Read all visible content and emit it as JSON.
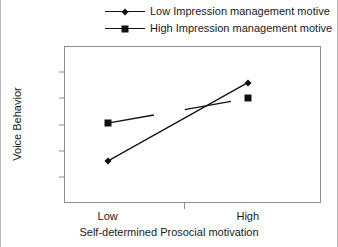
{
  "chart_data": {
    "type": "line",
    "title": "",
    "xlabel": "Self-determined Prosocial motivation",
    "ylabel": "Voice Behavior",
    "categories": [
      "Low",
      "High"
    ],
    "ylim": [
      1,
      2.2
    ],
    "yticks": [
      "1",
      "1.2",
      "1.4",
      "1.6",
      "1.8",
      "2",
      "2.2"
    ],
    "ytick_values": [
      1,
      1.2,
      1.4,
      1.6,
      1.8,
      2,
      2.2
    ],
    "grid": false,
    "legend_position": "top-center",
    "series": [
      {
        "name": "Low Impression management motive",
        "marker": "diamond",
        "values": [
          1.32,
          1.92
        ]
      },
      {
        "name": "High Impression management motive",
        "marker": "square",
        "values": [
          1.61,
          1.8
        ]
      }
    ]
  },
  "legend": {
    "items": [
      {
        "label": "Low Impression management motive",
        "marker": "diamond-marker"
      },
      {
        "label": "High Impression management motive",
        "marker": "square-marker"
      }
    ]
  },
  "axes": {
    "y_title": "Voice Behavior",
    "x_title": "Self-determined Prosocial motivation",
    "y_ticks": [
      "2.2",
      "2",
      "1.8",
      "1.6",
      "1.4",
      "1.2",
      "1"
    ],
    "x_ticks": [
      "Low",
      "High"
    ]
  }
}
